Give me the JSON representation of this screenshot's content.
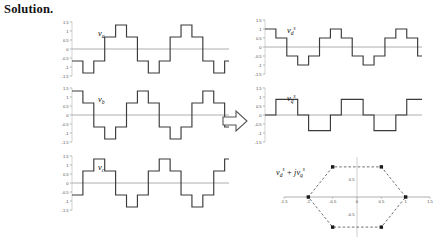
{
  "page": {
    "heading": "Solution.",
    "width": 434,
    "height": 243,
    "background": "#ffffff",
    "trace_color": "#3a3a3a",
    "axis_color": "#9a9a9a",
    "tick_color": "#4a4a4a"
  },
  "arrow": {
    "name": "right-arrow",
    "direction": "right"
  },
  "chart_data": [
    {
      "type": "line",
      "id": "v_a",
      "title": "v_a",
      "label_base": "v",
      "label_sub": "a",
      "label_sup": "",
      "xlabel": "",
      "ylabel": "",
      "ylim": [
        -1.5,
        1.5
      ],
      "xlim": [
        0,
        2.4
      ],
      "yticks": [
        1.5,
        1,
        0.5,
        0,
        -0.5,
        -1,
        -1.5
      ],
      "ytick_labels": [
        "1.5",
        "1",
        "0.5",
        "0",
        "-0.5",
        "-1",
        "-1.5"
      ],
      "grid": false,
      "step": true,
      "x": [
        0.0,
        0.1667,
        0.3333,
        0.5,
        0.6667,
        0.8333,
        1.0,
        1.1667,
        1.3333,
        1.5,
        1.6667,
        1.8333,
        2.0,
        2.1667,
        2.3333,
        2.4
      ],
      "values": [
        -0.6667,
        -1.3333,
        -0.6667,
        0.6667,
        1.3333,
        0.6667,
        -0.6667,
        -1.3333,
        -0.6667,
        0.6667,
        1.3333,
        0.6667,
        -0.6667,
        -1.3333,
        -0.6667,
        -0.6667
      ]
    },
    {
      "type": "line",
      "id": "v_b",
      "title": "v_b",
      "label_base": "v",
      "label_sub": "b",
      "label_sup": "",
      "xlabel": "",
      "ylabel": "",
      "ylim": [
        -1.5,
        1.5
      ],
      "xlim": [
        0,
        2.4
      ],
      "yticks": [
        1.5,
        1,
        0.5,
        0,
        -0.5,
        -1,
        -1.5
      ],
      "ytick_labels": [
        "1.5",
        "1",
        "0.5",
        "0",
        "-0.5",
        "-1",
        "-1.5"
      ],
      "grid": false,
      "step": true,
      "x": [
        0.0,
        0.1667,
        0.3333,
        0.5,
        0.6667,
        0.8333,
        1.0,
        1.1667,
        1.3333,
        1.5,
        1.6667,
        1.8333,
        2.0,
        2.1667,
        2.3333,
        2.4
      ],
      "values": [
        1.3333,
        0.6667,
        -0.6667,
        -1.3333,
        -0.6667,
        0.6667,
        1.3333,
        0.6667,
        -0.6667,
        -1.3333,
        -0.6667,
        0.6667,
        1.3333,
        0.6667,
        -0.6667,
        -0.6667
      ]
    },
    {
      "type": "line",
      "id": "v_c",
      "title": "v_c",
      "label_base": "v",
      "label_sub": "c",
      "label_sup": "",
      "xlabel": "",
      "ylabel": "",
      "ylim": [
        -1.5,
        1.5
      ],
      "xlim": [
        0,
        2.4
      ],
      "yticks": [
        1.5,
        1,
        0.5,
        0,
        -0.5,
        -1,
        -1.5
      ],
      "ytick_labels": [
        "1.5",
        "1",
        "0.5",
        "0",
        "-0.5",
        "-1",
        "-1.5"
      ],
      "grid": false,
      "step": true,
      "x": [
        0.0,
        0.1667,
        0.3333,
        0.5,
        0.6667,
        0.8333,
        1.0,
        1.1667,
        1.3333,
        1.5,
        1.6667,
        1.8333,
        2.0,
        2.1667,
        2.3333,
        2.4
      ],
      "values": [
        -0.6667,
        0.6667,
        1.3333,
        0.6667,
        -0.6667,
        -1.3333,
        -0.6667,
        0.6667,
        1.3333,
        0.6667,
        -0.6667,
        -1.3333,
        -0.6667,
        0.6667,
        1.3333,
        1.3333
      ]
    },
    {
      "type": "line",
      "id": "v_d_s",
      "title": "v_d^s",
      "label_base": "v",
      "label_sub": "d",
      "label_sup": "s",
      "xlabel": "",
      "ylabel": "",
      "ylim": [
        -1.5,
        1.5
      ],
      "xlim": [
        0,
        2.4
      ],
      "yticks": [
        1.5,
        1,
        0.5,
        0,
        -0.5,
        -1,
        -1.5
      ],
      "ytick_labels": [
        "1.5",
        "1",
        "0.5",
        "0",
        "-0.5",
        "-1",
        "-1.5"
      ],
      "grid": false,
      "step": true,
      "x": [
        0.0,
        0.1667,
        0.3333,
        0.5,
        0.6667,
        0.8333,
        1.0,
        1.1667,
        1.3333,
        1.5,
        1.6667,
        1.8333,
        2.0,
        2.1667,
        2.3333,
        2.4
      ],
      "values": [
        1.0,
        0.5,
        -0.5,
        -1.0,
        -0.5,
        0.5,
        1.0,
        0.5,
        -0.5,
        -1.0,
        -0.5,
        0.5,
        1.0,
        0.5,
        -0.5,
        -0.5
      ]
    },
    {
      "type": "line",
      "id": "v_q_s",
      "title": "v_q^s",
      "label_base": "v",
      "label_sub": "q",
      "label_sup": "s",
      "xlabel": "",
      "ylabel": "",
      "ylim": [
        -1.5,
        1.5
      ],
      "xlim": [
        0,
        2.4
      ],
      "yticks": [
        1.5,
        1,
        0.5,
        0,
        -0.5,
        -1,
        -1.5
      ],
      "ytick_labels": [
        "1.5",
        "1",
        "0.5",
        "0",
        "-0.5",
        "-1",
        "-1.5"
      ],
      "grid": false,
      "step": true,
      "x": [
        0.0,
        0.1667,
        0.3333,
        0.5,
        0.6667,
        0.8333,
        1.0,
        1.1667,
        1.3333,
        1.5,
        1.6667,
        1.8333,
        2.0,
        2.1667,
        2.3333,
        2.4
      ],
      "values": [
        0.0,
        0.866,
        0.866,
        0.0,
        -0.866,
        -0.866,
        0.0,
        0.866,
        0.866,
        0.0,
        -0.866,
        -0.866,
        0.0,
        0.866,
        0.866,
        0.866
      ]
    },
    {
      "type": "scatter",
      "id": "hexagon",
      "title": "v_d^s + jv_q^s",
      "label_parts": {
        "base1": "v",
        "sub1": "d",
        "sup1": "s",
        "op": "+ j",
        "base2": "v",
        "sub2": "q",
        "sup2": "s"
      },
      "xlabel": "",
      "ylabel": "",
      "xlim": [
        -1.5,
        1.5
      ],
      "ylim": [
        -1.15,
        1.15
      ],
      "xticks": [
        -1.5,
        -1,
        -0.5,
        0,
        0.5,
        1,
        1.5
      ],
      "xtick_labels": [
        "-1.5",
        "-1",
        "-0.5",
        "0",
        "0.5",
        "1",
        "1.5"
      ],
      "yticks": [
        0.5,
        0,
        -0.5
      ],
      "ytick_labels": [
        "0.5",
        "0",
        "-0.5"
      ],
      "grid": false,
      "marker": "square",
      "edge_style": "dashed",
      "points": [
        {
          "x": 1.0,
          "y": 0.0
        },
        {
          "x": 0.5,
          "y": 0.866
        },
        {
          "x": -0.5,
          "y": 0.866
        },
        {
          "x": -1.0,
          "y": 0.0
        },
        {
          "x": -0.5,
          "y": -0.866
        },
        {
          "x": 0.5,
          "y": -0.866
        }
      ]
    }
  ]
}
